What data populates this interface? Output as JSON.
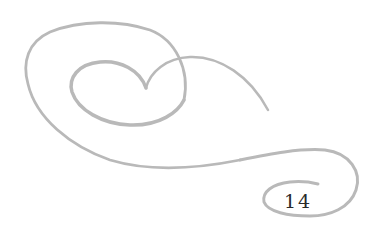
{
  "ornament": {
    "type": "decorative-swirl",
    "stroke_color": "#b8b8b8"
  },
  "page_number": "14"
}
